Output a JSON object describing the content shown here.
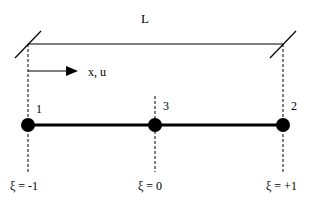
{
  "diagram": {
    "length_label": "L",
    "axis_label": "x, u",
    "nodes": [
      {
        "id": "1",
        "x": 28,
        "xi_label": "ξ = -1"
      },
      {
        "id": "3",
        "x": 155,
        "xi_label": "ξ = 0"
      },
      {
        "id": "2",
        "x": 283,
        "xi_label": "ξ = +1"
      }
    ],
    "colors": {
      "stroke": "#000000",
      "background": "#ffffff"
    }
  }
}
